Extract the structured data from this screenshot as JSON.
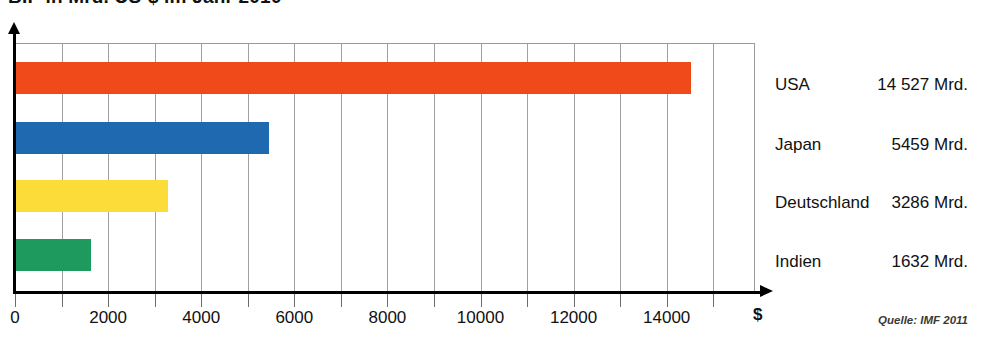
{
  "chart_data": {
    "type": "bar",
    "orientation": "horizontal",
    "title": "BIP in Mrd. US-$ im Jahr 2010",
    "xlabel": "$",
    "ylabel": "",
    "xlim": [
      0,
      15900
    ],
    "grid": true,
    "legend": false,
    "categories": [
      "USA",
      "Japan",
      "Deutschland",
      "Indien"
    ],
    "values": [
      14527,
      5459,
      3286,
      1632
    ],
    "value_labels": [
      "14 527 Mrd.",
      "5459 Mrd.",
      "3286 Mrd.",
      "1632 Mrd."
    ],
    "colors": [
      "#F0491A",
      "#1F69B0",
      "#FBDC38",
      "#1E9A5F"
    ],
    "tick_values": [
      0,
      1000,
      2000,
      3000,
      4000,
      5000,
      6000,
      7000,
      8000,
      9000,
      10000,
      11000,
      12000,
      13000,
      14000,
      15000
    ],
    "tick_labels": [
      {
        "value": 0,
        "label": "0"
      },
      {
        "value": 2000,
        "label": "2000"
      },
      {
        "value": 4000,
        "label": "4000"
      },
      {
        "value": 6000,
        "label": "6000"
      },
      {
        "value": 8000,
        "label": "8000"
      },
      {
        "value": 10000,
        "label": "10000"
      },
      {
        "value": 12000,
        "label": "12000"
      },
      {
        "value": 14000,
        "label": "14000"
      }
    ],
    "source": "Quelle: IMF 2011"
  },
  "series_rows": [
    {
      "name": "USA",
      "value_label": "14 527 Mrd."
    },
    {
      "name": "Japan",
      "value_label": "5459 Mrd."
    },
    {
      "name": "Deutschland",
      "value_label": "3286 Mrd."
    },
    {
      "name": "Indien",
      "value_label": "1632 Mrd."
    }
  ],
  "axis": {
    "unit_symbol": "$"
  },
  "footer": {
    "source": "Quelle: IMF 2011"
  }
}
